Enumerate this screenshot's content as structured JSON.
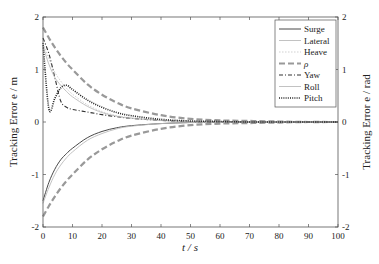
{
  "chart_data": {
    "type": "line",
    "title": "",
    "xlabel": "t / s",
    "ylabel_left": "Tracking Error e / m",
    "ylabel_right": "Tracking Error e / rad",
    "xlim": [
      0,
      100
    ],
    "ylim_left": [
      -2,
      2
    ],
    "ylim_right": [
      -2,
      2
    ],
    "x_ticks": [
      "0",
      "10",
      "20",
      "30",
      "40",
      "50",
      "60",
      "70",
      "80",
      "90",
      "100"
    ],
    "y_ticks_left": [
      "-2",
      "-1",
      "0",
      "1",
      "2"
    ],
    "y_ticks_right": [
      "-2",
      "-1",
      "0",
      "1",
      "2"
    ],
    "grid": false,
    "legend_position": "upper right",
    "x": [
      0,
      2,
      4,
      6,
      8,
      10,
      15,
      20,
      25,
      30,
      40,
      50,
      60,
      70,
      80,
      90,
      100
    ],
    "series": [
      {
        "name": "Surge",
        "style": "solid",
        "color": "#333333",
        "values": [
          -1.5,
          -1.15,
          -0.9,
          -0.72,
          -0.6,
          -0.5,
          -0.3,
          -0.18,
          -0.11,
          -0.07,
          -0.03,
          -0.01,
          0,
          0,
          0,
          0,
          0
        ]
      },
      {
        "name": "Lateral",
        "style": "solid-light",
        "color": "#bbbbbb",
        "values": [
          -1.55,
          -1.25,
          -1.0,
          -0.82,
          -0.68,
          -0.57,
          -0.35,
          -0.22,
          -0.13,
          -0.08,
          -0.03,
          -0.01,
          0,
          0,
          0,
          0,
          0
        ]
      },
      {
        "name": "Heave",
        "style": "dotted-light",
        "color": "#cccccc",
        "values": [
          1.5,
          1.2,
          0.95,
          0.78,
          0.64,
          0.53,
          0.33,
          0.2,
          0.12,
          0.08,
          0.03,
          0.01,
          0,
          0,
          0,
          0,
          0
        ]
      },
      {
        "name": "ρ",
        "style": "dashed-thick",
        "color": "#999999",
        "values": [
          1.8,
          1.6,
          1.42,
          1.26,
          1.12,
          1.0,
          0.72,
          0.52,
          0.37,
          0.26,
          0.13,
          0.06,
          0.03,
          0.02,
          0.01,
          0,
          0
        ]
      },
      {
        "name": "ρ (negative)",
        "style": "dashed-thick",
        "color": "#999999",
        "values": [
          -1.8,
          -1.6,
          -1.42,
          -1.26,
          -1.12,
          -1.0,
          -0.72,
          -0.52,
          -0.37,
          -0.26,
          -0.13,
          -0.06,
          -0.03,
          -0.02,
          -0.01,
          0,
          0
        ]
      },
      {
        "name": "Yaw",
        "style": "dash-dot",
        "color": "#333333",
        "values": [
          1.6,
          1.3,
          0.85,
          0.4,
          0.28,
          0.24,
          0.19,
          0.14,
          0.1,
          0.07,
          0.03,
          0.01,
          0,
          0,
          0,
          0,
          0
        ]
      },
      {
        "name": "Roll",
        "style": "solid-light",
        "color": "#bbbbbb",
        "values": [
          1.45,
          1.1,
          0.85,
          0.7,
          0.58,
          0.48,
          0.3,
          0.18,
          0.11,
          0.07,
          0.03,
          0.01,
          0,
          0,
          0,
          0,
          0
        ]
      },
      {
        "name": "Pitch",
        "style": "dotted",
        "color": "#222222",
        "values": [
          1.5,
          0.25,
          0.45,
          0.65,
          0.7,
          0.62,
          0.42,
          0.28,
          0.18,
          0.12,
          0.05,
          0.02,
          0.01,
          0,
          0,
          0,
          0
        ]
      }
    ]
  },
  "legend": {
    "items": [
      {
        "label": "Surge"
      },
      {
        "label": "Lateral"
      },
      {
        "label": "Heave"
      },
      {
        "label": "ρ"
      },
      {
        "label": "Yaw"
      },
      {
        "label": "Roll"
      },
      {
        "label": "Pitch"
      }
    ]
  }
}
